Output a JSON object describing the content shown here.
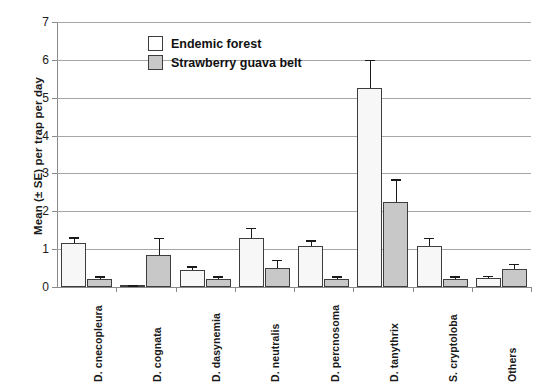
{
  "chart_data": {
    "type": "bar",
    "title": "",
    "xlabel": "",
    "ylabel": "Mean (± SE) per trap per day",
    "ylim": [
      0,
      7
    ],
    "yticks": [
      0,
      1,
      2,
      3,
      4,
      5,
      6,
      7
    ],
    "grid": true,
    "legend_position": "top-center",
    "categories": [
      "D. cnecopleura",
      "D. cognata",
      "D. dasynemia",
      "D. neutralis",
      "D. percnosoma",
      "D. tanythrix",
      "S. cryptoloba",
      "Others"
    ],
    "series": [
      {
        "name": "Endemic forest",
        "color": "#f7f7f7",
        "values": [
          1.15,
          0.03,
          0.45,
          1.3,
          1.08,
          5.25,
          1.08,
          0.25
        ],
        "errors": [
          0.17,
          0.02,
          0.1,
          0.27,
          0.16,
          0.75,
          0.22,
          0.05
        ]
      },
      {
        "name": "Strawberry guava belt",
        "color": "#c8c8c8",
        "values": [
          0.22,
          0.85,
          0.22,
          0.5,
          0.22,
          2.25,
          0.22,
          0.48
        ],
        "errors": [
          0.06,
          0.45,
          0.07,
          0.22,
          0.07,
          0.6,
          0.07,
          0.14
        ]
      }
    ]
  },
  "legend": {
    "items": [
      {
        "label": "Endemic forest",
        "style": "light"
      },
      {
        "label": "Strawberry guava belt",
        "style": "dark"
      }
    ]
  }
}
